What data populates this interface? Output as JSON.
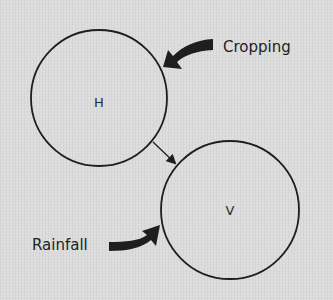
{
  "diagram": {
    "background_color": "#dcdcdc",
    "stroke_color": "#1e1e1e",
    "nodes": [
      {
        "id": "H",
        "label": "H",
        "cx": 99,
        "cy": 98,
        "r": 68
      },
      {
        "id": "V",
        "label": "V",
        "cx": 230,
        "cy": 210,
        "r": 69
      }
    ],
    "edges": [
      {
        "from": "H",
        "to": "V",
        "style": "thin-arrow"
      }
    ],
    "external_influences": [
      {
        "label": "Cropping",
        "target": "H",
        "style": "bold-curved-arrow"
      },
      {
        "label": "Rainfall",
        "target": "V",
        "style": "bold-curved-arrow"
      }
    ]
  }
}
